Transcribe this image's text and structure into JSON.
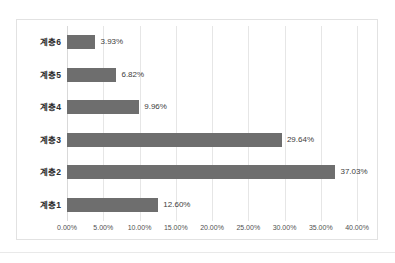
{
  "chart_data": {
    "type": "bar",
    "orientation": "horizontal",
    "title": "",
    "subtitle": "",
    "xlabel": "",
    "ylabel": "",
    "categories": [
      "계층1",
      "계층2",
      "계층3",
      "계층4",
      "계층5",
      "계층6"
    ],
    "values": [
      12.6,
      37.03,
      29.64,
      9.96,
      6.82,
      3.93
    ],
    "data_labels": [
      "12.60%",
      "37.03%",
      "29.64%",
      "9.96%",
      "6.82%",
      "3.93%"
    ],
    "display_order_top_to_bottom": [
      "계층6",
      "계층5",
      "계층4",
      "계층3",
      "계층2",
      "계층1"
    ],
    "xlim": [
      0,
      40
    ],
    "xtick_values": [
      0,
      5,
      10,
      15,
      20,
      25,
      30,
      35,
      40
    ],
    "xtick_labels": [
      "0.00%",
      "5.00%",
      "10.00%",
      "15.00%",
      "20.00%",
      "25.00%",
      "30.00%",
      "35.00%",
      "40.00%"
    ],
    "grid": {
      "vertical": true,
      "horizontal": false
    },
    "legend": {
      "shown": false,
      "position": "none"
    },
    "series": [
      {
        "name": "",
        "color": "#6e6e6e",
        "points": [
          {
            "category": "계층6",
            "value": 3.93,
            "label": "3.93%"
          },
          {
            "category": "계층5",
            "value": 6.82,
            "label": "6.82%"
          },
          {
            "category": "계층4",
            "value": 9.96,
            "label": "9.96%"
          },
          {
            "category": "계층3",
            "value": 29.64,
            "label": "29.64%"
          },
          {
            "category": "계층2",
            "value": 37.03,
            "label": "37.03%"
          },
          {
            "category": "계층1",
            "value": 12.6,
            "label": "12.60%"
          }
        ]
      }
    ],
    "colors": {
      "bar": "#6e6e6e",
      "gridline": "#e6e6e6",
      "frame_border": "#e2e2e2",
      "category_text": "#2b2b2b",
      "value_text": "#404040",
      "tick_text": "#515151",
      "background": "#ffffff"
    }
  }
}
